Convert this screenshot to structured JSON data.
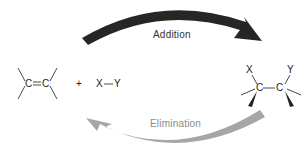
{
  "diagram": {
    "arrows": {
      "addition": {
        "label": "Addition",
        "color": "#262626",
        "direction": "left-to-right"
      },
      "elimination": {
        "label": "Elimination",
        "color": "#a6a6a6",
        "label_color": "#8a8a8a",
        "direction": "right-to-left"
      }
    },
    "reactants": {
      "alkene": {
        "atom1": "C",
        "bond": "=",
        "atom2": "C"
      },
      "plus": "+",
      "reagent": {
        "atom1": "X",
        "bond": "—",
        "atom2": "Y"
      }
    },
    "product": {
      "substituent_left": "X",
      "substituent_right": "Y",
      "atom1": "C",
      "bond": "—",
      "atom2": "C"
    }
  }
}
